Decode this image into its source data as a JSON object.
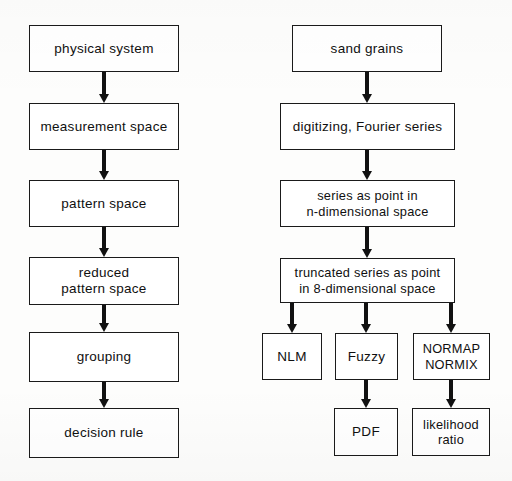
{
  "figure": {
    "kind": "flowchart",
    "ink_color": "#111111",
    "box_fill": "#ffffff",
    "page_background": "#fdfdfc"
  },
  "left_column": {
    "name": "generic pattern recognition chain",
    "nodes": [
      {
        "id": "physical-system",
        "label": "physical system"
      },
      {
        "id": "measurement-space",
        "label": "measurement space"
      },
      {
        "id": "pattern-space",
        "label": "pattern space"
      },
      {
        "id": "reduced-pattern-space",
        "label": "reduced\npattern space"
      },
      {
        "id": "grouping",
        "label": "grouping"
      },
      {
        "id": "decision-rule",
        "label": "decision rule"
      }
    ],
    "edges": [
      {
        "from": "physical-system",
        "to": "measurement-space"
      },
      {
        "from": "measurement-space",
        "to": "pattern-space"
      },
      {
        "from": "pattern-space",
        "to": "reduced-pattern-space"
      },
      {
        "from": "reduced-pattern-space",
        "to": "grouping"
      },
      {
        "from": "grouping",
        "to": "decision-rule"
      }
    ]
  },
  "right_column": {
    "name": "sand grain analysis chain",
    "nodes": [
      {
        "id": "sand-grains",
        "label": "sand grains"
      },
      {
        "id": "digitizing-fourier",
        "label": "digitizing, Fourier series"
      },
      {
        "id": "series-n-dim",
        "label": "series as point in\nn-dimensional space"
      },
      {
        "id": "truncated-8-dim",
        "label": "truncated series as point\nin 8-dimensional space"
      },
      {
        "id": "nlm",
        "label": "NLM"
      },
      {
        "id": "fuzzy",
        "label": "Fuzzy"
      },
      {
        "id": "normap-normix",
        "label": "NORMAP\nNORMIX"
      },
      {
        "id": "pdf",
        "label": "PDF"
      },
      {
        "id": "likelihood-ratio",
        "label": "likelihood\nratio"
      }
    ],
    "edges": [
      {
        "from": "sand-grains",
        "to": "digitizing-fourier"
      },
      {
        "from": "digitizing-fourier",
        "to": "series-n-dim"
      },
      {
        "from": "series-n-dim",
        "to": "truncated-8-dim"
      },
      {
        "from": "truncated-8-dim",
        "to": "nlm"
      },
      {
        "from": "truncated-8-dim",
        "to": "fuzzy"
      },
      {
        "from": "truncated-8-dim",
        "to": "normap-normix"
      },
      {
        "from": "fuzzy",
        "to": "pdf"
      },
      {
        "from": "normap-normix",
        "to": "likelihood-ratio"
      }
    ]
  }
}
